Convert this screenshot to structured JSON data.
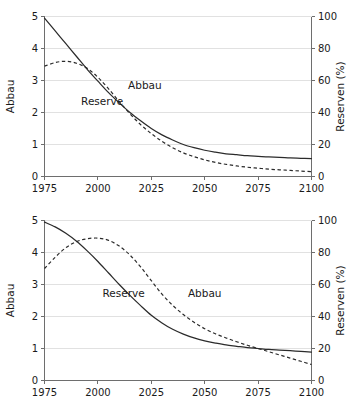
{
  "figure": {
    "name": "resource-depletion-two-panel-figure",
    "panel_count": 2
  },
  "chart_data": [
    {
      "type": "line",
      "title": "",
      "subtitle": "",
      "xlabel": "",
      "ylabel": "Abbau",
      "y2label": "Reserven (%)",
      "xlim": [
        1975,
        2100
      ],
      "ylim": [
        0,
        5
      ],
      "y2lim": [
        0,
        100
      ],
      "xticks": [
        1975,
        2000,
        2025,
        2050,
        2075,
        2100
      ],
      "xticklabels": [
        "1975",
        "2000",
        "2025",
        "2050",
        "2075",
        "2100"
      ],
      "yticks": [
        0,
        1,
        2,
        3,
        4,
        5
      ],
      "yticklabels": [
        "0",
        "1",
        "2",
        "3",
        "4",
        "5"
      ],
      "y2ticks": [
        0,
        20,
        40,
        60,
        80,
        100
      ],
      "y2ticklabels": [
        "0",
        "20",
        "40",
        "60",
        "80",
        "100"
      ],
      "grid": true,
      "legend_position": "inline-annotation",
      "x": [
        1975,
        1980,
        1985,
        1990,
        1995,
        2000,
        2005,
        2010,
        2015,
        2020,
        2025,
        2030,
        2035,
        2040,
        2045,
        2050,
        2055,
        2060,
        2065,
        2070,
        2075,
        2080,
        2085,
        2090,
        2095,
        2100
      ],
      "series": [
        {
          "name": "Reserve",
          "style": "solid",
          "axis": "left",
          "label": "Reserve",
          "values": [
            4.95,
            4.55,
            4.15,
            3.75,
            3.35,
            2.98,
            2.62,
            2.3,
            2.0,
            1.74,
            1.5,
            1.3,
            1.14,
            1.0,
            0.9,
            0.82,
            0.76,
            0.71,
            0.68,
            0.65,
            0.63,
            0.61,
            0.6,
            0.58,
            0.57,
            0.56
          ]
        },
        {
          "name": "Abbau",
          "style": "dashed",
          "axis": "right",
          "label": "Abbau",
          "values": [
            3.45,
            3.56,
            3.6,
            3.54,
            3.38,
            3.1,
            2.74,
            2.34,
            1.96,
            1.62,
            1.34,
            1.1,
            0.9,
            0.74,
            0.62,
            0.52,
            0.44,
            0.38,
            0.33,
            0.29,
            0.26,
            0.23,
            0.21,
            0.19,
            0.17,
            0.15
          ]
        }
      ],
      "annotations": [
        {
          "text": "Reserve",
          "x": 2002,
          "y": 2.25
        },
        {
          "text": "Abbau",
          "x": 2022,
          "y": 2.72
        }
      ]
    },
    {
      "type": "line",
      "title": "",
      "subtitle": "",
      "xlabel": "",
      "ylabel": "Abbau",
      "y2label": "Reserven (%)",
      "xlim": [
        1975,
        2100
      ],
      "ylim": [
        0,
        5
      ],
      "y2lim": [
        0,
        100
      ],
      "xticks": [
        1975,
        2000,
        2025,
        2050,
        2075,
        2100
      ],
      "xticklabels": [
        "1975",
        "2000",
        "2025",
        "2050",
        "2075",
        "2100"
      ],
      "yticks": [
        0,
        1,
        2,
        3,
        4,
        5
      ],
      "yticklabels": [
        "0",
        "1",
        "2",
        "3",
        "4",
        "5"
      ],
      "y2ticks": [
        0,
        20,
        40,
        60,
        80,
        100
      ],
      "y2ticklabels": [
        "0",
        "20",
        "40",
        "60",
        "80",
        "100"
      ],
      "grid": true,
      "legend_position": "inline-annotation",
      "x": [
        1975,
        1980,
        1985,
        1990,
        1995,
        2000,
        2005,
        2010,
        2015,
        2020,
        2025,
        2030,
        2035,
        2040,
        2045,
        2050,
        2055,
        2060,
        2065,
        2070,
        2075,
        2080,
        2085,
        2090,
        2095,
        2100
      ],
      "series": [
        {
          "name": "Reserve",
          "style": "solid",
          "axis": "left",
          "label": "Reserve",
          "values": [
            4.95,
            4.8,
            4.6,
            4.35,
            4.05,
            3.72,
            3.36,
            3.0,
            2.66,
            2.34,
            2.04,
            1.8,
            1.6,
            1.45,
            1.33,
            1.24,
            1.17,
            1.11,
            1.07,
            1.03,
            1.0,
            0.97,
            0.95,
            0.93,
            0.91,
            0.89
          ]
        },
        {
          "name": "Abbau",
          "style": "dashed",
          "axis": "right",
          "label": "Abbau",
          "values": [
            3.5,
            3.85,
            4.15,
            4.34,
            4.43,
            4.45,
            4.38,
            4.2,
            3.92,
            3.55,
            3.12,
            2.7,
            2.35,
            2.06,
            1.82,
            1.62,
            1.46,
            1.33,
            1.21,
            1.1,
            1.0,
            0.9,
            0.8,
            0.7,
            0.6,
            0.5
          ]
        }
      ],
      "annotations": [
        {
          "text": "Reserve",
          "x": 2012,
          "y": 2.62
        },
        {
          "text": "Abbau",
          "x": 2050,
          "y": 2.62
        }
      ]
    }
  ]
}
